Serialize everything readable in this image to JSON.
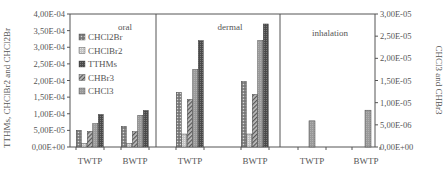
{
  "chart_data": {
    "type": "bar",
    "title": "",
    "ylabel_left": "TTHMs, CHClBr2 and CHCl2Br",
    "ylabel_right": "CHCl3 and CHBr3",
    "ylim_left": [
      0,
      0.0004
    ],
    "ylim_right": [
      0,
      3e-05
    ],
    "yticks_left": [
      "0,00E+00",
      "5,00E-05",
      "1,00E-04",
      "1,50E-04",
      "2,00E-04",
      "2,50E-04",
      "3,00E-04",
      "3,50E-04",
      "4,00E-04"
    ],
    "yticks_right": [
      "0,00E+00",
      "5,00E-06",
      "1,00E-05",
      "1,50E-05",
      "2,00E-05",
      "2,50E-05",
      "3,00E-05"
    ],
    "panels": [
      "oral",
      "dermal",
      "inhalation"
    ],
    "categories": [
      "TWTP",
      "BWTP",
      "TWTP",
      "BWTP",
      "TWTP",
      "BWTP"
    ],
    "legend": [
      "CHCl2Br",
      "CHClBr2",
      "TTHMs",
      "CHBr3",
      "CHCl3"
    ],
    "legend_position": "upper-left inside oral panel",
    "grid": false,
    "series": [
      {
        "name": "CHCl2Br",
        "axis": "left",
        "values": [
          5e-05,
          6.2e-05,
          0.000164,
          0.000197,
          null,
          null
        ]
      },
      {
        "name": "CHClBr2",
        "axis": "left",
        "values": [
          1e-05,
          1e-05,
          3.9e-05,
          3.9e-05,
          null,
          null
        ]
      },
      {
        "name": "CHBr3",
        "axis": "left",
        "values": [
          4.7e-05,
          4.6e-05,
          0.000143,
          0.000158,
          null,
          null
        ]
      },
      {
        "name": "CHCl3",
        "axis": "left",
        "values": [
          7e-05,
          9.5e-05,
          0.000233,
          0.00032,
          null,
          null
        ]
      },
      {
        "name": "TTHMs",
        "axis": "left",
        "values": [
          9.8e-05,
          0.00011,
          0.00032,
          0.00037,
          null,
          null
        ]
      },
      {
        "name": "CHCl3 (inhalation)",
        "axis": "right",
        "values": [
          null,
          null,
          null,
          null,
          5.9e-06,
          8.3e-06
        ]
      }
    ]
  }
}
